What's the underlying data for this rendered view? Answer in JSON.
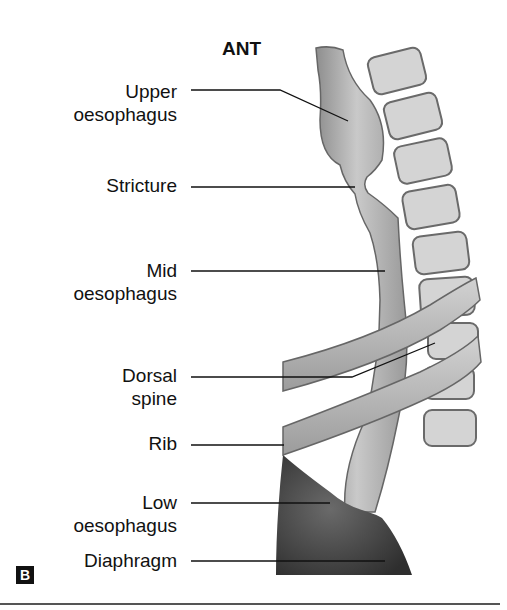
{
  "figure": {
    "orientation_label": "ANT",
    "panel_badge": "B",
    "labels": [
      {
        "id": "upper",
        "line1": "Upper",
        "line2": "oesophagus"
      },
      {
        "id": "stricture",
        "line1": "Stricture"
      },
      {
        "id": "mid",
        "line1": "Mid",
        "line2": "oesophagus"
      },
      {
        "id": "dorsal",
        "line1": "Dorsal",
        "line2": "spine"
      },
      {
        "id": "rib",
        "line1": "Rib"
      },
      {
        "id": "low",
        "line1": "Low",
        "line2": "oesophagus"
      },
      {
        "id": "diaphragm",
        "line1": "Diaphragm"
      }
    ],
    "colors": {
      "oesophagus": "#b8b8b8",
      "vertebra": "#d4d4d4",
      "rib": "#bdbdbd",
      "diaphragm": "#4a4a4a",
      "outline": "#555555",
      "leader": "#111111"
    }
  }
}
